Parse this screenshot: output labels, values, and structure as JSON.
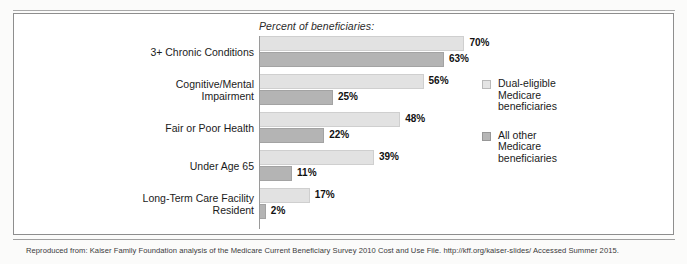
{
  "figure": {
    "header": "Percent of beneficiaries:",
    "source_note": "Reproduced from: Kaiser Family Foundation analysis of the Medicare Current Beneficiary Survey 2010 Cost and Use File. http://kff.org/kaiser-slides/ Accessed Summer 2015."
  },
  "legend": {
    "items": [
      {
        "label_line1": "Dual-eligible",
        "label_line2": "Medicare",
        "label_line3": "beneficiaries",
        "color": "#e2e2e2",
        "key": "dual"
      },
      {
        "label_line1": "All other",
        "label_line2": "Medicare",
        "label_line3": "beneficiaries",
        "color": "#b4b4b4",
        "key": "other"
      }
    ]
  },
  "chart_data": {
    "type": "bar",
    "orientation": "horizontal",
    "title": "Percent of beneficiaries:",
    "xlabel": "",
    "ylabel": "",
    "xlim": [
      0,
      70
    ],
    "grid": false,
    "legend_position": "right",
    "value_suffix": "%",
    "categories": [
      "3+ Chronic Conditions",
      "Cognitive/Mental Impairment",
      "Fair or Poor Health",
      "Under Age 65",
      "Long-Term Care Facility Resident"
    ],
    "category_lines": [
      [
        "3+ Chronic Conditions"
      ],
      [
        "Cognitive/Mental",
        "Impairment"
      ],
      [
        "Fair or Poor Health"
      ],
      [
        "Under Age 65"
      ],
      [
        "Long-Term Care Facility",
        "Resident"
      ]
    ],
    "series": [
      {
        "name": "Dual-eligible Medicare beneficiaries",
        "color": "#e2e2e2",
        "values": [
          70,
          56,
          48,
          39,
          17
        ],
        "labels": [
          "70%",
          "56%",
          "48%",
          "39%",
          "17%"
        ]
      },
      {
        "name": "All other Medicare beneficiaries",
        "color": "#b4b4b4",
        "values": [
          63,
          25,
          22,
          11,
          2
        ],
        "labels": [
          "63%",
          "25%",
          "22%",
          "11%",
          "2%"
        ]
      }
    ]
  }
}
